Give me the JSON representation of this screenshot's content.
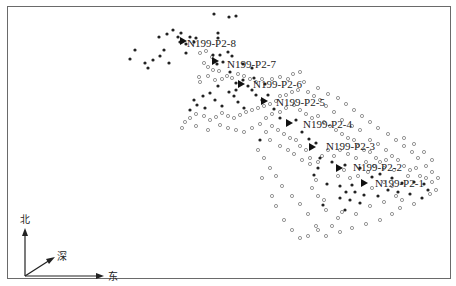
{
  "figure": {
    "frame_color": "#6a6a6a",
    "event_fill_color": "#222222",
    "event_open_color": "#8a8a8a",
    "stage_marker_color": "#111111"
  },
  "compass": {
    "north": "北",
    "depth": "深",
    "east": "东"
  },
  "stages": [
    {
      "label": "N199-P2-8",
      "marker": [
        183,
        41
      ],
      "text": [
        187,
        47
      ]
    },
    {
      "label": "N199-P2-7",
      "marker": [
        215,
        61
      ],
      "text": [
        227,
        68
      ]
    },
    {
      "label": "N199-P2-6",
      "marker": [
        241,
        84
      ],
      "text": [
        253,
        88
      ]
    },
    {
      "label": "N199-P2-5",
      "marker": [
        264,
        101
      ],
      "text": [
        276,
        106
      ]
    },
    {
      "label": "N199-P2-4",
      "marker": [
        289,
        123
      ],
      "text": [
        303,
        128
      ]
    },
    {
      "label": "N199-P2-3",
      "marker": [
        312,
        147
      ],
      "text": [
        326,
        150
      ]
    },
    {
      "label": "N199-P2-2",
      "marker": [
        339,
        168
      ],
      "text": [
        353,
        171
      ]
    },
    {
      "label": "N199-P2-1",
      "marker": [
        364,
        183
      ],
      "text": [
        375,
        187
      ]
    }
  ],
  "filled_events": [
    [
      214,
      14
    ],
    [
      229,
      17
    ],
    [
      236,
      16
    ],
    [
      218,
      33
    ],
    [
      218,
      38
    ],
    [
      167,
      34
    ],
    [
      181,
      33
    ],
    [
      173,
      30
    ],
    [
      178,
      37
    ],
    [
      190,
      37
    ],
    [
      196,
      38
    ],
    [
      194,
      42
    ],
    [
      180,
      42
    ],
    [
      186,
      44
    ],
    [
      159,
      37
    ],
    [
      164,
      50
    ],
    [
      135,
      50
    ],
    [
      130,
      59
    ],
    [
      145,
      63
    ],
    [
      153,
      60
    ],
    [
      160,
      56
    ],
    [
      169,
      63
    ],
    [
      148,
      68
    ],
    [
      186,
      53
    ],
    [
      213,
      55
    ],
    [
      220,
      55
    ],
    [
      217,
      64
    ],
    [
      223,
      62
    ],
    [
      230,
      72
    ],
    [
      236,
      83
    ],
    [
      243,
      80
    ],
    [
      248,
      86
    ],
    [
      252,
      90
    ],
    [
      236,
      90
    ],
    [
      229,
      92
    ],
    [
      218,
      86
    ],
    [
      210,
      93
    ],
    [
      203,
      96
    ],
    [
      197,
      105
    ],
    [
      190,
      110
    ],
    [
      194,
      100
    ],
    [
      205,
      108
    ],
    [
      215,
      100
    ],
    [
      222,
      106
    ],
    [
      234,
      96
    ],
    [
      238,
      102
    ],
    [
      244,
      108
    ],
    [
      256,
      95
    ],
    [
      262,
      100
    ],
    [
      268,
      95
    ],
    [
      274,
      109
    ],
    [
      280,
      118
    ],
    [
      296,
      120
    ],
    [
      302,
      132
    ],
    [
      309,
      139
    ],
    [
      316,
      143
    ],
    [
      320,
      158
    ],
    [
      332,
      162
    ],
    [
      345,
      165
    ],
    [
      360,
      168
    ],
    [
      372,
      177
    ],
    [
      380,
      174
    ],
    [
      392,
      178
    ],
    [
      402,
      183
    ],
    [
      414,
      182
    ],
    [
      424,
      184
    ],
    [
      428,
      190
    ],
    [
      422,
      198
    ],
    [
      410,
      194
    ],
    [
      398,
      192
    ],
    [
      388,
      190
    ],
    [
      378,
      196
    ],
    [
      364,
      195
    ],
    [
      355,
      192
    ],
    [
      352,
      185
    ],
    [
      346,
      192
    ],
    [
      340,
      186
    ],
    [
      340,
      198
    ],
    [
      350,
      200
    ],
    [
      360,
      203
    ],
    [
      345,
      210
    ],
    [
      323,
      205
    ],
    [
      327,
      184
    ],
    [
      314,
      175
    ],
    [
      318,
      168
    ],
    [
      260,
      140
    ],
    [
      265,
      84
    ],
    [
      254,
      78
    ],
    [
      252,
      68
    ],
    [
      243,
      64
    ],
    [
      232,
      56
    ],
    [
      228,
      52
    ]
  ],
  "open_events": [
    [
      200,
      53
    ],
    [
      206,
      51
    ],
    [
      212,
      57
    ],
    [
      204,
      63
    ],
    [
      208,
      67
    ],
    [
      213,
      70
    ],
    [
      219,
      71
    ],
    [
      208,
      76
    ],
    [
      199,
      77
    ],
    [
      200,
      82
    ],
    [
      215,
      80
    ],
    [
      222,
      79
    ],
    [
      227,
      76
    ],
    [
      232,
      78
    ],
    [
      238,
      74
    ],
    [
      244,
      76
    ],
    [
      250,
      79
    ],
    [
      256,
      82
    ],
    [
      262,
      79
    ],
    [
      272,
      79
    ],
    [
      280,
      77
    ],
    [
      288,
      79
    ],
    [
      293,
      74
    ],
    [
      300,
      72
    ],
    [
      304,
      82
    ],
    [
      298,
      90
    ],
    [
      292,
      92
    ],
    [
      286,
      95
    ],
    [
      280,
      96
    ],
    [
      276,
      101
    ],
    [
      270,
      104
    ],
    [
      264,
      106
    ],
    [
      258,
      108
    ],
    [
      252,
      110
    ],
    [
      246,
      112
    ],
    [
      240,
      115
    ],
    [
      234,
      118
    ],
    [
      228,
      116
    ],
    [
      222,
      113
    ],
    [
      216,
      117
    ],
    [
      210,
      120
    ],
    [
      204,
      116
    ],
    [
      196,
      114
    ],
    [
      190,
      118
    ],
    [
      185,
      122
    ],
    [
      182,
      128
    ],
    [
      196,
      126
    ],
    [
      208,
      130
    ],
    [
      220,
      125
    ],
    [
      228,
      128
    ],
    [
      236,
      130
    ],
    [
      244,
      132
    ],
    [
      252,
      128
    ],
    [
      260,
      124
    ],
    [
      266,
      118
    ],
    [
      272,
      114
    ],
    [
      280,
      112
    ],
    [
      286,
      108
    ],
    [
      294,
      105
    ],
    [
      300,
      110
    ],
    [
      306,
      114
    ],
    [
      312,
      118
    ],
    [
      318,
      116
    ],
    [
      324,
      122
    ],
    [
      330,
      126
    ],
    [
      336,
      130
    ],
    [
      342,
      134
    ],
    [
      348,
      138
    ],
    [
      354,
      140
    ],
    [
      358,
      146
    ],
    [
      364,
      150
    ],
    [
      370,
      152
    ],
    [
      376,
      158
    ],
    [
      380,
      162
    ],
    [
      386,
      160
    ],
    [
      392,
      156
    ],
    [
      398,
      160
    ],
    [
      404,
      166
    ],
    [
      410,
      170
    ],
    [
      416,
      168
    ],
    [
      420,
      176
    ],
    [
      426,
      178
    ],
    [
      432,
      182
    ],
    [
      436,
      190
    ],
    [
      430,
      194
    ],
    [
      408,
      176
    ],
    [
      394,
      170
    ],
    [
      384,
      168
    ],
    [
      374,
      166
    ],
    [
      366,
      162
    ],
    [
      356,
      158
    ],
    [
      348,
      154
    ],
    [
      340,
      150
    ],
    [
      334,
      156
    ],
    [
      328,
      150
    ],
    [
      322,
      156
    ],
    [
      318,
      162
    ],
    [
      310,
      158
    ],
    [
      306,
      150
    ],
    [
      300,
      146
    ],
    [
      296,
      140
    ],
    [
      290,
      138
    ],
    [
      284,
      134
    ],
    [
      278,
      130
    ],
    [
      272,
      126
    ],
    [
      266,
      132
    ],
    [
      270,
      140
    ],
    [
      280,
      146
    ],
    [
      288,
      150
    ],
    [
      294,
      154
    ],
    [
      302,
      160
    ],
    [
      310,
      164
    ],
    [
      316,
      180
    ],
    [
      312,
      188
    ],
    [
      318,
      196
    ],
    [
      324,
      200
    ],
    [
      326,
      210
    ],
    [
      338,
      218
    ],
    [
      332,
      226
    ],
    [
      316,
      226
    ],
    [
      308,
      214
    ],
    [
      300,
      204
    ],
    [
      292,
      196
    ],
    [
      282,
      186
    ],
    [
      276,
      176
    ],
    [
      270,
      168
    ],
    [
      264,
      158
    ],
    [
      258,
      150
    ],
    [
      262,
      178
    ],
    [
      272,
      196
    ],
    [
      276,
      206
    ],
    [
      284,
      220
    ],
    [
      292,
      230
    ],
    [
      300,
      238
    ],
    [
      308,
      236
    ],
    [
      318,
      230
    ],
    [
      326,
      236
    ],
    [
      340,
      232
    ],
    [
      352,
      228
    ],
    [
      366,
      224
    ],
    [
      380,
      220
    ],
    [
      392,
      214
    ],
    [
      400,
      208
    ],
    [
      396,
      196
    ],
    [
      384,
      202
    ],
    [
      370,
      206
    ],
    [
      356,
      214
    ],
    [
      342,
      212
    ],
    [
      344,
      170
    ],
    [
      338,
      176
    ],
    [
      350,
      178
    ],
    [
      358,
      176
    ],
    [
      368,
      172
    ],
    [
      372,
      188
    ],
    [
      384,
      182
    ],
    [
      392,
      186
    ],
    [
      402,
      200
    ],
    [
      414,
      204
    ],
    [
      386,
      150
    ],
    [
      378,
      144
    ],
    [
      370,
      140
    ],
    [
      360,
      130
    ],
    [
      352,
      126
    ],
    [
      342,
      120
    ],
    [
      334,
      112
    ],
    [
      326,
      106
    ],
    [
      320,
      100
    ],
    [
      314,
      96
    ],
    [
      308,
      92
    ],
    [
      318,
      88
    ],
    [
      328,
      94
    ],
    [
      338,
      98
    ],
    [
      346,
      104
    ],
    [
      354,
      110
    ],
    [
      362,
      116
    ],
    [
      370,
      122
    ],
    [
      378,
      128
    ],
    [
      388,
      134
    ],
    [
      396,
      140
    ],
    [
      404,
      146
    ],
    [
      412,
      152
    ],
    [
      418,
      158
    ],
    [
      426,
      166
    ],
    [
      432,
      172
    ],
    [
      438,
      178
    ],
    [
      432,
      160
    ],
    [
      424,
      152
    ],
    [
      414,
      144
    ],
    [
      404,
      138
    ]
  ]
}
